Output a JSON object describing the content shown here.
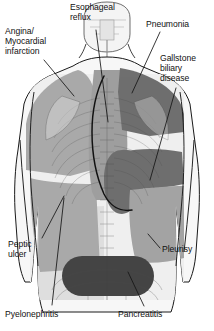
{
  "diagram": {
    "view": "posterior torso with arms at sides",
    "labels": [
      {
        "id": "angina",
        "name": "angina-myocardial-infarction-label",
        "text": "Angina/\nMyocardial\ninfarction"
      },
      {
        "id": "reflux",
        "name": "esophageal-reflux-label",
        "text": "Esophageal\nreflux"
      },
      {
        "id": "pneumonia",
        "name": "pneumonia-label",
        "text": "Pneumonia"
      },
      {
        "id": "gallstone",
        "name": "gallstone-biliary-disease-label",
        "text": "Gallstone\nbiliary\ndisease"
      },
      {
        "id": "peptic",
        "name": "peptic-ulcer-label",
        "text": "Peptic\nulcer"
      },
      {
        "id": "pleurisy",
        "name": "pleurisy-label",
        "text": "Pleurisy"
      },
      {
        "id": "pyelo",
        "name": "pyelonephritis-label",
        "text": "Pyelonephritis"
      },
      {
        "id": "pancreatitis",
        "name": "pancreatitis-label",
        "text": "Pancreatitis"
      }
    ],
    "colors": {
      "background": "#ffffff",
      "outline": "#1a1a1a",
      "skin_light": "#f2f2f2",
      "shade_pale": "#dcdcdc",
      "shade_light": "#cfcfcf",
      "shade_mid": "#a9a9a9",
      "shade_dark": "#6f6f6f",
      "shade_darkest": "#454545",
      "label_text": "#111111",
      "leader_line": "#1a1a1a"
    },
    "regions": [
      {
        "name": "angina-shade",
        "label_id": "angina",
        "tone": "shade_mid",
        "location": "left shoulder and upper back"
      },
      {
        "name": "reflux-shade",
        "label_id": "reflux",
        "tone": "shade_mid",
        "location": "central thoracic spine / esophagus track"
      },
      {
        "name": "pneumonia-shade",
        "label_id": "pneumonia",
        "tone": "shade_dark",
        "location": "right upper back / shoulder"
      },
      {
        "name": "gallstone-shade",
        "label_id": "gallstone",
        "tone": "shade_dark",
        "location": "right subcostal / inferior scapular"
      },
      {
        "name": "peptic-shade",
        "label_id": "peptic",
        "tone": "shade_mid",
        "location": "left mid back"
      },
      {
        "name": "pleurisy-shade",
        "label_id": "pleurisy",
        "tone": "shade_mid",
        "location": "right lower lateral flank"
      },
      {
        "name": "pyelonephritis-shade",
        "label_id": "pyelo",
        "tone": "shade_light",
        "location": "left lower flank / loin"
      },
      {
        "name": "pancreatitis-shade",
        "label_id": "pancreatitis",
        "tone": "shade_darkest",
        "location": "lower back band above pelvis"
      }
    ]
  }
}
